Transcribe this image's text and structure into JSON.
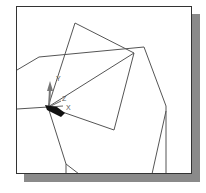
{
  "viewport": {
    "background": "#ffffff",
    "border_color": "#333333",
    "shadow_color": "#8a8a8a",
    "line_color": "#555555"
  },
  "triad": {
    "x_label": "X",
    "y_label": "Y",
    "z_label": "Z"
  }
}
